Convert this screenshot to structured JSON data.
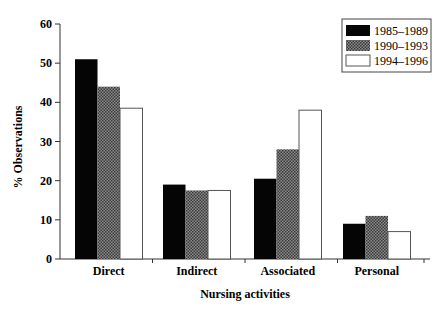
{
  "chart_data": {
    "type": "bar",
    "title": "",
    "xlabel": "Nursing activities",
    "ylabel": "% Observations",
    "ylim": [
      0,
      60
    ],
    "yticks": [
      0,
      10,
      20,
      30,
      40,
      50,
      60
    ],
    "grid": false,
    "legend_position": "top-right",
    "categories": [
      "Direct",
      "Indirect",
      "Associated",
      "Personal"
    ],
    "series": [
      {
        "name": "1985–1989",
        "fill": "black",
        "values": [
          51,
          19,
          20.5,
          9
        ]
      },
      {
        "name": "1990–1993",
        "fill": "hatched-grey",
        "values": [
          44,
          17.5,
          28,
          11
        ]
      },
      {
        "name": "1994–1996",
        "fill": "white",
        "values": [
          38.5,
          17.5,
          38,
          7
        ]
      }
    ]
  },
  "colors": {
    "series_1": "#050505",
    "series_2": "#6a6a6a",
    "series_3": "#ffffff",
    "axis": "#333333"
  }
}
